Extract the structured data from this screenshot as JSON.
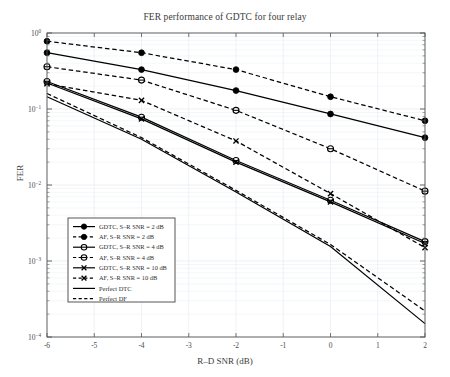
{
  "chart_data": {
    "type": "line",
    "title": "FER performance of GDTC for four relay",
    "xlabel": "R–D SNR (dB)",
    "ylabel": "FER",
    "xlim": [
      -6,
      2
    ],
    "ylim": [
      0.0001,
      1
    ],
    "yscale": "log",
    "grid": true,
    "legend_position": "lower left",
    "xticks": [
      "-6",
      "-5",
      "-4",
      "-3",
      "-2",
      "-1",
      "0",
      "1",
      "2"
    ],
    "xtick_values": [
      -6,
      -5,
      -4,
      -3,
      -2,
      -1,
      0,
      1,
      2
    ],
    "yticks": [
      "10^0",
      "10^-1",
      "10^-2",
      "10^-3",
      "10^-4"
    ],
    "ytick_values": [
      1,
      0.1,
      0.01,
      0.001,
      0.0001
    ],
    "x": [
      -6,
      -4,
      -2,
      0,
      2
    ],
    "series": [
      {
        "name": "GDTC, S–R SNR = 2 dB",
        "values": [
          0.55,
          0.33,
          0.175,
          0.086,
          0.042
        ],
        "style": "solid",
        "marker": "filled-circle",
        "color": "#000000"
      },
      {
        "name": "AF, S–R SNR = 2 dB",
        "values": [
          0.78,
          0.55,
          0.33,
          0.145,
          0.07
        ],
        "style": "dashed",
        "marker": "filled-circle",
        "color": "#000000"
      },
      {
        "name": "GDTC, S–R SNR = 4 dB",
        "values": [
          0.23,
          0.078,
          0.021,
          0.0063,
          0.0018
        ],
        "style": "solid",
        "marker": "open-circle",
        "color": "#000000"
      },
      {
        "name": "AF, S–R SNR = 4 dB",
        "values": [
          0.36,
          0.24,
          0.096,
          0.03,
          0.0083
        ],
        "style": "dashed",
        "marker": "open-circle",
        "color": "#000000"
      },
      {
        "name": "GDTC, S–R SNR = 10 dB",
        "values": [
          0.22,
          0.074,
          0.02,
          0.006,
          0.0017
        ],
        "style": "solid",
        "marker": "cross",
        "color": "#000000"
      },
      {
        "name": "AF, S–R SNR = 10 dB",
        "values": [
          0.215,
          0.13,
          0.038,
          0.0077,
          0.0015
        ],
        "style": "dashed",
        "marker": "cross",
        "color": "#000000"
      },
      {
        "name": "Perfect DTC",
        "values": [
          0.145,
          0.04,
          0.0081,
          0.00155,
          0.00015
        ],
        "style": "solid",
        "marker": "none",
        "color": "#000000"
      },
      {
        "name": "Perfect DF",
        "values": [
          0.16,
          0.042,
          0.0085,
          0.00165,
          0.00022
        ],
        "style": "dashed",
        "marker": "none",
        "color": "#000000"
      }
    ]
  }
}
